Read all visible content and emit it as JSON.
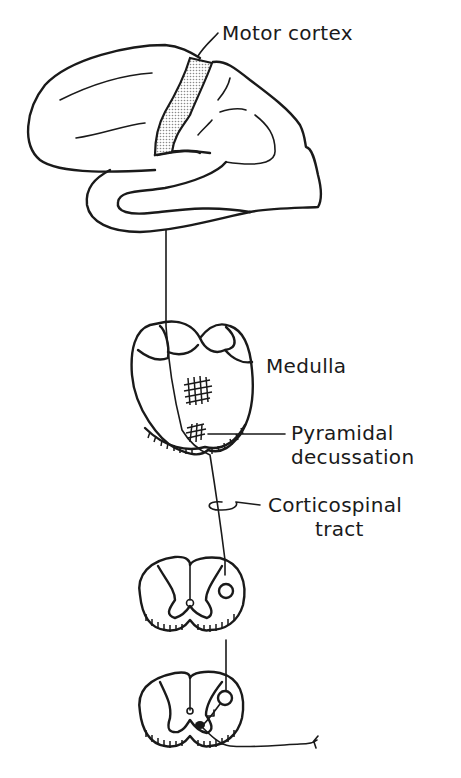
{
  "diagram": {
    "labels": {
      "motor_cortex": "Motor cortex",
      "medulla": "Medulla",
      "pyramidal_decussation_line1": "Pyramidal",
      "pyramidal_decussation_line2": "decussation",
      "corticospinal_tract_line1": "Corticospinal",
      "corticospinal_tract_line2": "tract"
    },
    "structures": [
      "brain (lateral view)",
      "motor cortex (shaded)",
      "medulla cross-section",
      "pyramidal decussation",
      "spinal cord section (upper)",
      "spinal cord section (lower)",
      "peripheral motor nerve"
    ],
    "colors": {
      "ink": "#1a1a1a",
      "motor_cortex_fill": "#d9d9d9",
      "background": "#ffffff"
    }
  }
}
